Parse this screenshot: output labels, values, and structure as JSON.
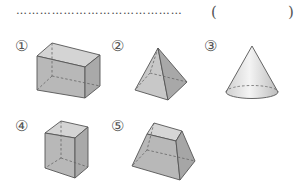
{
  "answer_line": {
    "leader": "……………………………………",
    "open_paren": "(",
    "close_paren": ")",
    "answer": ""
  },
  "shapes": [
    {
      "label": "①",
      "name": "rectangular prism (cuboid)"
    },
    {
      "label": "②",
      "name": "square pyramid"
    },
    {
      "label": "③",
      "name": "cone"
    },
    {
      "label": "④",
      "name": "cube-like rectangular prism"
    },
    {
      "label": "⑤",
      "name": "square frustum"
    }
  ],
  "colors": {
    "face_fill": "#b9b9b9",
    "face_light": "#d6d6d6",
    "edge": "#555555",
    "hidden_edge": "#666666"
  }
}
